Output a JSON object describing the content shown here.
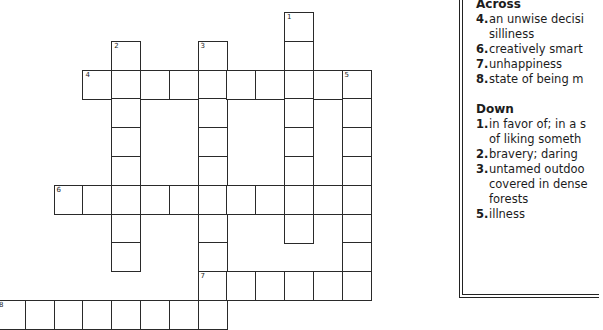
{
  "puzzle": {
    "cell_size": 28.8,
    "origin_x": -4,
    "origin_y": 12,
    "words": [
      {
        "number": 1,
        "direction": "down",
        "col": 10,
        "row": 0,
        "length": 8
      },
      {
        "number": 2,
        "direction": "down",
        "col": 4,
        "row": 1,
        "length": 8
      },
      {
        "number": 3,
        "direction": "down",
        "col": 7,
        "row": 1,
        "length": 10
      },
      {
        "number": 4,
        "direction": "across",
        "col": 3,
        "row": 2,
        "length": 10
      },
      {
        "number": 5,
        "direction": "down",
        "col": 12,
        "row": 2,
        "length": 8
      },
      {
        "number": 6,
        "direction": "across",
        "col": 2,
        "row": 6,
        "length": 10
      },
      {
        "number": 7,
        "direction": "across",
        "col": 7,
        "row": 9,
        "length": 6
      },
      {
        "number": 8,
        "direction": "across",
        "col": 0,
        "row": 10,
        "length": 8
      }
    ]
  },
  "clues": {
    "across_heading": "Across",
    "down_heading": "Down",
    "across": [
      {
        "num": "4.",
        "lines": [
          "an unwise decisi",
          "silliness"
        ]
      },
      {
        "num": "6.",
        "lines": [
          "creatively smart"
        ]
      },
      {
        "num": "7.",
        "lines": [
          "unhappiness"
        ]
      },
      {
        "num": "8.",
        "lines": [
          "state of being m"
        ]
      }
    ],
    "down": [
      {
        "num": "1.",
        "lines": [
          "in favor of; in a s",
          "of liking someth"
        ]
      },
      {
        "num": "2.",
        "lines": [
          "bravery; daring"
        ]
      },
      {
        "num": "3.",
        "lines": [
          "untamed outdoo",
          "covered in dense",
          "forests"
        ]
      },
      {
        "num": "5.",
        "lines": [
          "illness"
        ]
      }
    ]
  }
}
